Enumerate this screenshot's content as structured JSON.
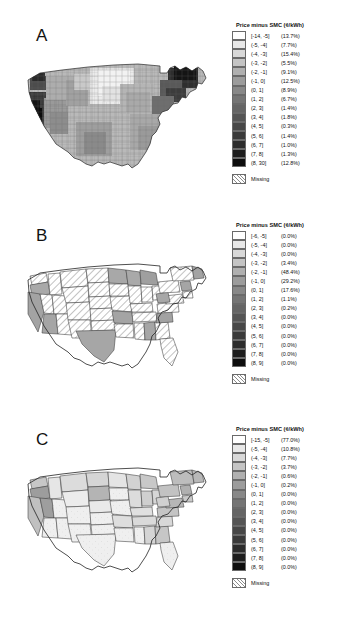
{
  "figure": {
    "legend_title": "Price minus SMC (¢/kWh)",
    "missing_label": "Missing",
    "swatch_colors": [
      "#ffffff",
      "#e8e8e8",
      "#d8d8d8",
      "#c4c4c4",
      "#b0b0b0",
      "#9c9c9c",
      "#888888",
      "#757575",
      "#656565",
      "#555555",
      "#474747",
      "#3a3a3a",
      "#2c2c2c",
      "#1e1e1e",
      "#0d0d0d"
    ]
  },
  "chart_data": {
    "type": "heatmap",
    "panels": [
      {
        "label": "A",
        "geography": "county",
        "legend_title": "Price minus SMC (¢/kWh)",
        "missing_label": "Missing",
        "bins": [
          {
            "range": "[-14, -5]",
            "share": "(13.7%)",
            "value": 13.7,
            "color": "#ffffff"
          },
          {
            "range": "(-5, -4]",
            "share": "(7.7%)",
            "value": 7.7,
            "color": "#e8e8e8"
          },
          {
            "range": "(-4, -3]",
            "share": "(15.4%)",
            "value": 15.4,
            "color": "#d8d8d8"
          },
          {
            "range": "(-3, -2]",
            "share": "(5.5%)",
            "value": 5.5,
            "color": "#c4c4c4"
          },
          {
            "range": "(-2, -1]",
            "share": "(9.1%)",
            "value": 9.1,
            "color": "#b0b0b0"
          },
          {
            "range": "(-1, 0]",
            "share": "(12.5%)",
            "value": 12.5,
            "color": "#9c9c9c"
          },
          {
            "range": "(0, 1]",
            "share": "(8.9%)",
            "value": 8.9,
            "color": "#888888"
          },
          {
            "range": "(1, 2]",
            "share": "(6.7%)",
            "value": 6.7,
            "color": "#757575"
          },
          {
            "range": "(2, 3]",
            "share": "(1.4%)",
            "value": 1.4,
            "color": "#656565"
          },
          {
            "range": "(3, 4]",
            "share": "(1.8%)",
            "value": 1.8,
            "color": "#555555"
          },
          {
            "range": "(4, 5]",
            "share": "(0.3%)",
            "value": 0.3,
            "color": "#474747"
          },
          {
            "range": "(5, 6]",
            "share": "(1.4%)",
            "value": 1.4,
            "color": "#3a3a3a"
          },
          {
            "range": "(6, 7]",
            "share": "(1.0%)",
            "value": 1.0,
            "color": "#2c2c2c"
          },
          {
            "range": "(7, 8]",
            "share": "(1.3%)",
            "value": 1.3,
            "color": "#1e1e1e"
          },
          {
            "range": "(8, 30]",
            "share": "(12.8%)",
            "value": 12.8,
            "color": "#0d0d0d"
          }
        ]
      },
      {
        "label": "B",
        "geography": "state",
        "legend_title": "Price minus SMC (¢/kWh)",
        "missing_label": "Missing",
        "bins": [
          {
            "range": "[-6, -5]",
            "share": "(0.0%)",
            "value": 0.0,
            "color": "#ffffff"
          },
          {
            "range": "(-5, -4]",
            "share": "(0.0%)",
            "value": 0.0,
            "color": "#e8e8e8"
          },
          {
            "range": "(-4, -3]",
            "share": "(0.0%)",
            "value": 0.0,
            "color": "#d8d8d8"
          },
          {
            "range": "(-3, -2]",
            "share": "(3.4%)",
            "value": 3.4,
            "color": "#c4c4c4"
          },
          {
            "range": "(-2, -1]",
            "share": "(48.4%)",
            "value": 48.4,
            "color": "#b0b0b0"
          },
          {
            "range": "(-1, 0]",
            "share": "(29.2%)",
            "value": 29.2,
            "color": "#9c9c9c"
          },
          {
            "range": "(0, 1]",
            "share": "(17.6%)",
            "value": 17.6,
            "color": "#888888"
          },
          {
            "range": "(1, 2]",
            "share": "(1.1%)",
            "value": 1.1,
            "color": "#757575"
          },
          {
            "range": "(2, 3]",
            "share": "(0.2%)",
            "value": 0.2,
            "color": "#656565"
          },
          {
            "range": "(3, 4]",
            "share": "(0.0%)",
            "value": 0.0,
            "color": "#555555"
          },
          {
            "range": "(4, 5]",
            "share": "(0.0%)",
            "value": 0.0,
            "color": "#474747"
          },
          {
            "range": "(5, 6]",
            "share": "(0.0%)",
            "value": 0.0,
            "color": "#3a3a3a"
          },
          {
            "range": "(6, 7]",
            "share": "(0.0%)",
            "value": 0.0,
            "color": "#2c2c2c"
          },
          {
            "range": "(7, 8]",
            "share": "(0.0%)",
            "value": 0.0,
            "color": "#1e1e1e"
          },
          {
            "range": "(8, 9]",
            "share": "(0.0%)",
            "value": 0.0,
            "color": "#0d0d0d"
          }
        ]
      },
      {
        "label": "C",
        "geography": "state",
        "legend_title": "Price minus SMC (¢/kWh)",
        "missing_label": "Missing",
        "bins": [
          {
            "range": "[-15, -5]",
            "share": "(77.0%)",
            "value": 77.0,
            "color": "#ffffff"
          },
          {
            "range": "(-5, -4]",
            "share": "(10.8%)",
            "value": 10.8,
            "color": "#e8e8e8"
          },
          {
            "range": "(-4, -3]",
            "share": "(7.7%)",
            "value": 7.7,
            "color": "#d8d8d8"
          },
          {
            "range": "(-3, -2]",
            "share": "(3.7%)",
            "value": 3.7,
            "color": "#c4c4c4"
          },
          {
            "range": "(-2, -1]",
            "share": "(0.6%)",
            "value": 0.6,
            "color": "#b0b0b0"
          },
          {
            "range": "(-1, 0]",
            "share": "(0.2%)",
            "value": 0.2,
            "color": "#9c9c9c"
          },
          {
            "range": "(0, 1]",
            "share": "(0.0%)",
            "value": 0.0,
            "color": "#888888"
          },
          {
            "range": "(1, 2]",
            "share": "(0.0%)",
            "value": 0.0,
            "color": "#757575"
          },
          {
            "range": "(2, 3]",
            "share": "(0.0%)",
            "value": 0.0,
            "color": "#656565"
          },
          {
            "range": "(3, 4]",
            "share": "(0.0%)",
            "value": 0.0,
            "color": "#555555"
          },
          {
            "range": "(4, 5]",
            "share": "(0.0%)",
            "value": 0.0,
            "color": "#474747"
          },
          {
            "range": "(5, 6]",
            "share": "(0.0%)",
            "value": 0.0,
            "color": "#3a3a3a"
          },
          {
            "range": "(6, 7]",
            "share": "(0.0%)",
            "value": 0.0,
            "color": "#2c2c2c"
          },
          {
            "range": "(7, 8]",
            "share": "(0.0%)",
            "value": 0.0,
            "color": "#1e1e1e"
          },
          {
            "range": "(8, 9]",
            "share": "(0.0%)",
            "value": 0.0,
            "color": "#0d0d0d"
          }
        ]
      }
    ]
  }
}
